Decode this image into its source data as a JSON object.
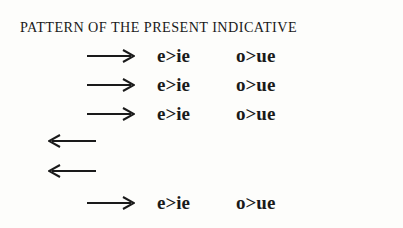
{
  "title": "PATTERN OF THE PRESENT INDICATIVE",
  "rows": [
    {
      "direction": "right",
      "icon": "right-arrow-icon",
      "e_change": "e>ie",
      "o_change": "o>ue"
    },
    {
      "direction": "right",
      "icon": "right-arrow-icon",
      "e_change": "e>ie",
      "o_change": "o>ue"
    },
    {
      "direction": "right",
      "icon": "right-arrow-icon",
      "e_change": "e>ie",
      "o_change": "o>ue"
    },
    {
      "direction": "left",
      "icon": "left-arrow-icon"
    },
    {
      "direction": "left",
      "icon": "left-arrow-icon"
    },
    {
      "direction": "right",
      "icon": "right-arrow-icon",
      "e_change": "e>ie",
      "o_change": "o>ue"
    }
  ]
}
